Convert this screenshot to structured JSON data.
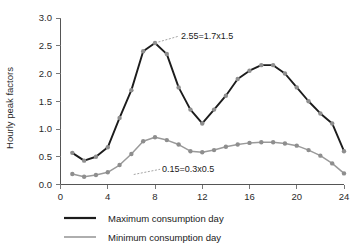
{
  "chart_data": {
    "type": "line",
    "title": "",
    "xlabel": "",
    "ylabel": "Hourly peak factors",
    "xlim": [
      0,
      24
    ],
    "ylim": [
      0,
      3.0
    ],
    "xticks": [
      "0",
      "4",
      "8",
      "12",
      "16",
      "20",
      "24"
    ],
    "xtick_values": [
      0,
      4,
      8,
      12,
      16,
      20,
      24
    ],
    "yticks": [
      "0.0",
      "0.5",
      "1.0",
      "1.5",
      "2.0",
      "2.5",
      "3.0"
    ],
    "ytick_values": [
      0.0,
      0.5,
      1.0,
      1.5,
      2.0,
      2.5,
      3.0
    ],
    "grid": false,
    "legend_position": "below",
    "x": [
      1,
      2,
      3,
      4,
      5,
      6,
      7,
      8,
      9,
      10,
      11,
      12,
      13,
      14,
      15,
      16,
      17,
      18,
      19,
      20,
      21,
      22,
      23,
      24
    ],
    "series": [
      {
        "name": "Maximum consumption day",
        "color": "#1c1c1c",
        "marker_color": "#8e8e8e",
        "values": [
          0.57,
          0.43,
          0.5,
          0.67,
          1.2,
          1.7,
          2.4,
          2.55,
          2.35,
          1.75,
          1.35,
          1.1,
          1.35,
          1.6,
          1.9,
          2.05,
          2.15,
          2.15,
          2.0,
          1.75,
          1.5,
          1.28,
          1.1,
          0.6
        ]
      },
      {
        "name": "Minimum consumption day",
        "color": "#9a9a9a",
        "marker_color": "#8e8e8e",
        "values": [
          0.19,
          0.14,
          0.17,
          0.22,
          0.35,
          0.55,
          0.78,
          0.85,
          0.8,
          0.72,
          0.6,
          0.58,
          0.62,
          0.68,
          0.72,
          0.75,
          0.76,
          0.76,
          0.74,
          0.7,
          0.62,
          0.52,
          0.38,
          0.2
        ]
      }
    ],
    "annotations": [
      {
        "text": "2.55=1.7x1.5",
        "target_x": 8,
        "target_y": 2.55,
        "label_x": 10.2,
        "label_y": 2.62
      },
      {
        "text": "0.15=0.3x0.5",
        "target_x": 6.2,
        "target_y": 0.18,
        "label_x": 8.6,
        "label_y": 0.22
      }
    ]
  },
  "legend": {
    "items": [
      {
        "label": "Maximum consumption day",
        "color": "#1c1c1c"
      },
      {
        "label": "Minimum consumption day",
        "color": "#9a9a9a"
      }
    ]
  }
}
